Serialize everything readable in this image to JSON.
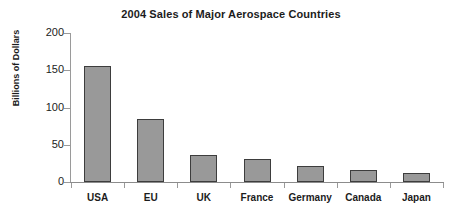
{
  "chart_data": {
    "type": "bar",
    "title": "2004 Sales of Major Aerospace Countries",
    "xlabel": "",
    "ylabel": "Billions of Dollars",
    "categories": [
      "USA",
      "EU",
      "UK",
      "France",
      "Germany",
      "Canada",
      "Japan"
    ],
    "values": [
      156,
      85,
      36,
      31,
      21,
      16,
      12
    ],
    "ylim": [
      0,
      200
    ],
    "yticks": [
      0,
      50,
      100,
      150,
      200
    ],
    "ytick_labels": [
      "0",
      "50",
      "100",
      "150",
      "200"
    ],
    "grid": false,
    "legend": null,
    "series": [
      {
        "name": "2004 Sales",
        "values": [
          156,
          85,
          36,
          31,
          21,
          16,
          12
        ]
      }
    ],
    "colors": {
      "bar_fill": "#999999",
      "bar_border": "#3d3d3d",
      "axis": "#9a9a9a",
      "text": "#1c1c1c",
      "background": "#ffffff"
    }
  }
}
